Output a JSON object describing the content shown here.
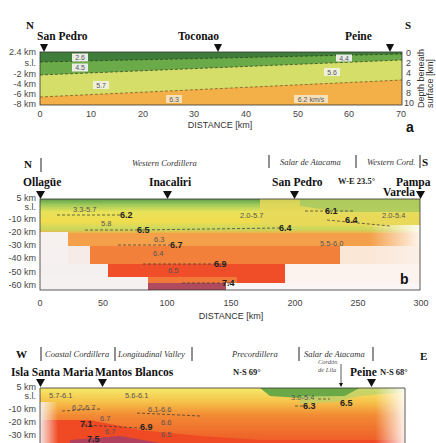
{
  "panel_a": {
    "label": "a",
    "dir_left": "N",
    "dir_right": "S",
    "stations": [
      {
        "name": "San Pedro",
        "km": 1
      },
      {
        "name": "Toconao",
        "km": 35
      },
      {
        "name": "Peine",
        "km": 68
      }
    ],
    "left_axis": [
      "2.4 km",
      "s.l.",
      "-2 km",
      "-4 km",
      "-6 km",
      "-8 km"
    ],
    "right_axis": [
      "0",
      "2",
      "4",
      "6",
      "8",
      "10"
    ],
    "right_axis_title_1": "Depth beneath",
    "right_axis_title_2": "surface [km]",
    "x_ticks": [
      "0",
      "10",
      "20",
      "30",
      "40",
      "50",
      "60",
      "70"
    ],
    "x_label": "DISTANCE [km]",
    "velocities": [
      "2.6",
      "4.5",
      "5.7",
      "6.3",
      "4.4",
      "5.6",
      "6.2 km/s"
    ]
  },
  "panel_b": {
    "label": "b",
    "dir_left": "N",
    "dir_right": "S",
    "regions": [
      "Western Cordillera",
      "Salar de Atacama",
      "Western Cord."
    ],
    "stations": [
      {
        "name": "Ollagüe",
        "km": 0
      },
      {
        "name": "Inacaliri",
        "km": 100
      },
      {
        "name": "San Pedro",
        "km": 200
      },
      {
        "name": "Pampa",
        "km": 300
      },
      {
        "name": "Varela",
        "km": 300
      }
    ],
    "bend_label": "W-E 23.5°",
    "left_axis": [
      "5 km",
      "s.l.",
      "-10 km",
      "-20 km",
      "-30 km",
      "-40 km",
      "-50 km",
      "-60 km"
    ],
    "x_ticks": [
      "0",
      "50",
      "100",
      "150",
      "200",
      "250",
      "300"
    ],
    "x_label": "DISTANCE [km]",
    "velocities_plain": [
      "3.3-5.7",
      "5.8",
      "6.3",
      "6.4",
      "6.5",
      "2.0-5.7",
      "5.5-6.0",
      "2.0-5.4"
    ],
    "velocities_bold": [
      "6.2",
      "6.5",
      "6.7",
      "6.9",
      "7.4",
      "6.4",
      "6.1",
      "6.4"
    ]
  },
  "panel_c": {
    "dir_left": "W",
    "dir_right": "E",
    "regions": [
      "Coastal Cordillera",
      "Longitudinal Valley",
      "Precordillera",
      "Salar de Atacama"
    ],
    "stations": [
      {
        "name": "Isla Santa Maria",
        "km": 0
      },
      {
        "name": "Mantos Blancos",
        "km": 50
      },
      {
        "name": "Peine",
        "km": 265
      }
    ],
    "bend_labels": [
      "N-S 69°",
      "N-S 68°"
    ],
    "cordon_label_1": "Cordón",
    "cordon_label_2": "de Lila",
    "left_axis": [
      "5 km",
      "s.l.",
      "-10 km",
      "-20 km",
      "-30 km"
    ],
    "velocities_plain": [
      "5.7-6.1",
      "6.2-6.7",
      "6.7",
      "6.7",
      "5.6-6.1",
      "6.1-6.6",
      "6.6",
      "6.5",
      "3.0-5.4"
    ],
    "velocities_bold": [
      "7.1",
      "6.9",
      "7.5",
      "6.3",
      "6.5"
    ]
  }
}
